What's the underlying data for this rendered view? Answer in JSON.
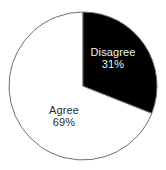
{
  "chart_data": {
    "type": "pie",
    "title": "",
    "subtitle": "",
    "xlabel": "",
    "ylabel": "",
    "legend_position": "none",
    "grid": false,
    "labels_inside_slices": true,
    "start_angle_deg": 0,
    "direction": "clockwise",
    "categories": [
      "Disagree",
      "Agree"
    ],
    "values": [
      31,
      69
    ],
    "units": "%",
    "slices": [
      {
        "name": "Disagree",
        "label": "Disagree",
        "value": 31,
        "value_text": "31%",
        "fill": "#000000",
        "stroke": "#6e6e6e",
        "text_color": "#f2f2f2",
        "start_angle_deg": 0,
        "end_angle_deg": 111.6
      },
      {
        "name": "Agree",
        "label": "Agree",
        "value": 69,
        "value_text": "69%",
        "fill": "#ffffff",
        "stroke": "#6e6e6e",
        "text_color": "#2b2b2b",
        "start_angle_deg": 111.6,
        "end_angle_deg": 360
      }
    ]
  },
  "figure": {
    "background": "#ffffff",
    "outline_color": "#6e6e6e"
  }
}
